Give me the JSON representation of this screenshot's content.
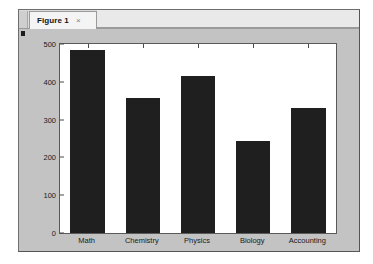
{
  "window": {
    "tab_label": "Figure 1",
    "close_icon": "×",
    "background_color": "#c3c3c3",
    "canvas_color": "#ffffff"
  },
  "chart_data": {
    "type": "bar",
    "title": "",
    "xlabel": "",
    "ylabel": "",
    "categories": [
      "Math",
      "Chemistry",
      "Physics",
      "Biology",
      "Accounting"
    ],
    "values": [
      483,
      358,
      416,
      244,
      332
    ],
    "ylim": [
      0,
      500
    ],
    "yticks": [
      0,
      100,
      200,
      300,
      400,
      500
    ],
    "ytick_labels": [
      "0",
      "100",
      "200",
      "300",
      "400",
      "500"
    ],
    "grid": false,
    "legend": null,
    "bar_color": "#1f1f1f",
    "axes_color": "#5a5a5a"
  }
}
